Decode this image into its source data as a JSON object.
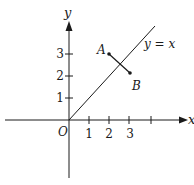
{
  "diagram": {
    "axes": {
      "x_label": "x",
      "y_label": "y",
      "origin_label": "O",
      "x_ticks": [
        "1",
        "2",
        "3"
      ],
      "y_ticks": [
        "1",
        "2",
        "3"
      ]
    },
    "line": {
      "label": "y = x",
      "equation": "y = x"
    },
    "points": [
      {
        "label": "A",
        "x": 2,
        "y": 3
      },
      {
        "label": "B",
        "x": 3,
        "y": 2
      }
    ],
    "segment": {
      "from": "A",
      "to": "B"
    },
    "colors": {
      "ink": "#1a1a1a",
      "background": "#ffffff"
    }
  }
}
